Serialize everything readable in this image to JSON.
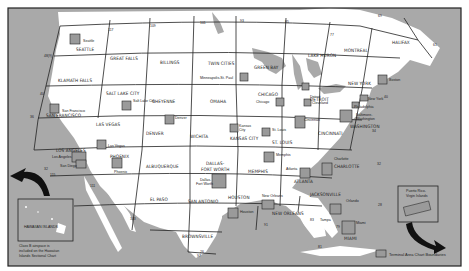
{
  "map": {
    "title": "Sectional and Terminal Area Chart Coverage",
    "colors": {
      "water": "#a9a9a9",
      "land": "#ffffff",
      "frame": "#222222",
      "terminal": "#9a9a9a",
      "line": "#333333"
    },
    "sectionals": [
      "SEATTLE",
      "GREAT FALLS",
      "BILLINGS",
      "TWIN CITIES",
      "GREEN BAY",
      "LAKE HURON",
      "MONTREAL",
      "HALIFAX",
      "KLAMATH FALLS",
      "SALT LAKE CITY",
      "CHEYENNE",
      "OMAHA",
      "CHICAGO",
      "DETROIT",
      "NEW YORK",
      "SAN FRANCISCO",
      "LAS VEGAS",
      "DENVER",
      "WICHITA",
      "KANSAS CITY",
      "ST. LOUIS",
      "CINCINNATI",
      "WASHINGTON",
      "LOS ANGELES",
      "PHOENIX",
      "ALBUQUERQUE",
      "DALLAS-FORT WORTH",
      "MEMPHIS",
      "ATLANTA",
      "CHARLOTTE",
      "EL PASO",
      "SAN ANTONIO",
      "HOUSTON",
      "NEW ORLEANS",
      "JACKSONVILLE",
      "BROWNSVILLE",
      "MIAMI"
    ],
    "terminal_areas": [
      "Seattle",
      "Minneapolis-St. Paul",
      "Salt Lake City",
      "Denver",
      "Chicago",
      "Detroit",
      "Cleveland",
      "Boston",
      "New York",
      "Philadelphia",
      "Baltimore-Washington",
      "Cincinnati",
      "San Francisco",
      "Las Vegas",
      "Kansas City",
      "St. Louis",
      "Los Angeles",
      "San Diego",
      "Phoenix",
      "Dallas-Ft Worth",
      "Memphis",
      "Atlanta",
      "Charlotte",
      "Houston",
      "New Orleans",
      "Orlando",
      "Tampa",
      "Miami",
      "Puerto Rico-Virgin Islands"
    ],
    "meridians": [
      "117",
      "109",
      "101",
      "93",
      "85",
      "77",
      "69",
      "61",
      "125",
      "122",
      "115",
      "103",
      "97",
      "89",
      "83",
      "81",
      "79",
      "71"
    ],
    "parallels": [
      "48",
      "44",
      "40",
      "36",
      "32",
      "28",
      "24"
    ],
    "hawaii": {
      "label": "HAWAIIAN ISLANDS",
      "note": "Class B airspace is included on the Hawaiian Islands Sectional Chart"
    },
    "puerto_rico": {
      "label": "Puerto Rico-Virgin Islands"
    },
    "legend": {
      "label": "Terminal Area Chart Boundaries"
    }
  }
}
